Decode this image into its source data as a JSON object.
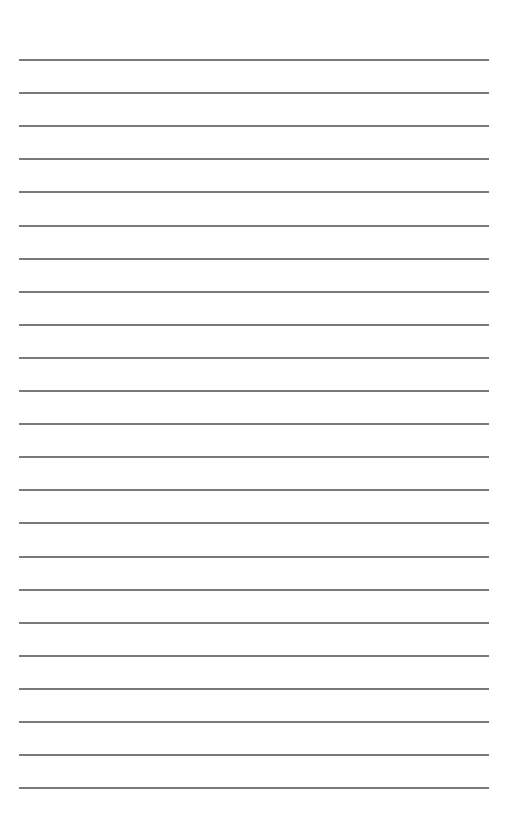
{
  "page": {
    "type": "lined-paper",
    "background": "#ffffff",
    "line_color": "#7a7a7a",
    "line_count": 23,
    "first_line_y": 59,
    "line_spacing": 33.1,
    "line_left": 19,
    "line_right": 489
  }
}
